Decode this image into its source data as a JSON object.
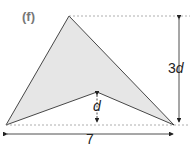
{
  "figure": {
    "label": "(f)",
    "height_label_coef": "3",
    "height_label_var": "d",
    "inner_height_label": "d",
    "width_label": "7",
    "fill_color": "#e6e6e6",
    "stroke_color": "#333333"
  }
}
